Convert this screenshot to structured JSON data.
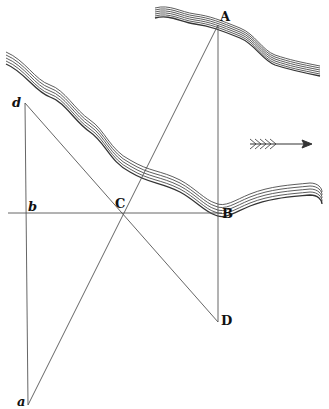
{
  "figure": {
    "type": "river width measurement by similar triangles",
    "points": {
      "A": {
        "label": "A",
        "x": 218,
        "y": 25
      },
      "B": {
        "label": "B",
        "x": 218,
        "y": 213
      },
      "C": {
        "label": "C",
        "x": 122,
        "y": 213
      },
      "D": {
        "label": "D",
        "x": 218,
        "y": 322
      },
      "d": {
        "label": "d",
        "x": 25,
        "y": 103
      },
      "b": {
        "label": "b",
        "x": 25,
        "y": 213
      },
      "a": {
        "label": "a",
        "x": 28,
        "y": 405
      }
    },
    "lines": [
      "A-D",
      "b-B",
      "A-a",
      "d-D",
      "d-a"
    ],
    "current_arrow": {
      "direction": "right",
      "icon": "arrow-right-icon"
    },
    "colors": {
      "line": "#555555",
      "river": "#333333",
      "background": "#ffffff"
    }
  }
}
